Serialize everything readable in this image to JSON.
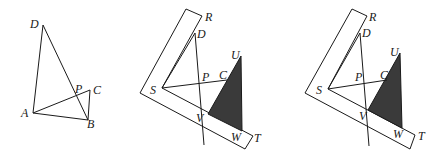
{
  "figures": [
    {
      "id": "figure-1",
      "description": "Quadrilateral ADBC with diagonals intersecting at P",
      "labels": {
        "D": "D",
        "A": "A",
        "B": "B",
        "C": "C",
        "P": "P"
      }
    },
    {
      "id": "figure-2",
      "description": "L-shaped ruler RST with shaded triangle UVW and lines DP, SC",
      "labels": {
        "R": "R",
        "D": "D",
        "U": "U",
        "S": "S",
        "P": "P",
        "C": "C",
        "V": "V",
        "W": "W",
        "T": "T"
      }
    },
    {
      "id": "figure-3",
      "description": "L-shaped ruler RST with shaded triangle UVW and lines DP, SC (variant)",
      "labels": {
        "R": "R",
        "D": "D",
        "U": "U",
        "S": "S",
        "P": "P",
        "C": "C",
        "V": "V",
        "W": "W",
        "T": "T"
      }
    }
  ],
  "colors": {
    "line": "#1a1a1a",
    "shade": "#3a3a3a",
    "background": "#ffffff"
  }
}
